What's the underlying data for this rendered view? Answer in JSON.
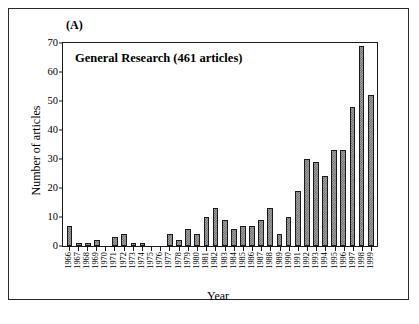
{
  "figure": {
    "panel_label": "(A)",
    "title": "General Research (461 articles)",
    "xlabel": "Year",
    "ylabel": "Number of articles"
  },
  "chart_data": {
    "type": "bar",
    "title": "General Research (461 articles)",
    "panel": "(A)",
    "xlabel": "Year",
    "ylabel": "Number of articles",
    "ylim": [
      0,
      70
    ],
    "yticks": [
      0,
      10,
      20,
      30,
      40,
      50,
      60,
      70
    ],
    "grid": false,
    "legend": null,
    "total_articles": 461,
    "bar_fill_color": "#a8a8a8",
    "bar_edge_color": "#1a1a1a",
    "categories": [
      "1966",
      "1967",
      "1968",
      "1969",
      "1970",
      "1971",
      "1972",
      "1973",
      "1974",
      "1975",
      "1976",
      "1977",
      "1978",
      "1979",
      "1980",
      "1981",
      "1982",
      "1983",
      "1984",
      "1985",
      "1986",
      "1987",
      "1988",
      "1989",
      "1990",
      "1991",
      "1992",
      "1993",
      "1994",
      "1995",
      "1996",
      "1997",
      "1998",
      "1999"
    ],
    "values": [
      7,
      1,
      1,
      2,
      0,
      3,
      4,
      1,
      1,
      0,
      0,
      4,
      2,
      6,
      4,
      10,
      13,
      9,
      6,
      7,
      7,
      9,
      13,
      4,
      10,
      19,
      30,
      29,
      24,
      33,
      33,
      48,
      69,
      52
    ]
  }
}
